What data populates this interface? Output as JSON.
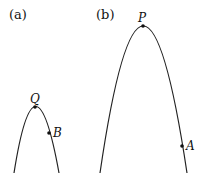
{
  "figure": {
    "panels": [
      {
        "label": "(a)",
        "curve": "downward parabola (narrow, short)",
        "vertex": {
          "name": "Q",
          "x": 35,
          "y": 107
        },
        "points": [
          {
            "name": "B",
            "x": 49,
            "y": 133
          }
        ],
        "ends": [
          {
            "x": 14,
            "y": 173
          },
          {
            "x": 59,
            "y": 173
          }
        ]
      },
      {
        "label": "(b)",
        "curve": "downward parabola (wide, tall)",
        "vertex": {
          "name": "P",
          "x": 143,
          "y": 26
        },
        "points": [
          {
            "name": "A",
            "x": 182,
            "y": 146
          }
        ],
        "ends": [
          {
            "x": 100,
            "y": 173
          },
          {
            "x": 187,
            "y": 173
          }
        ]
      }
    ],
    "colors": {
      "stroke": "#222222",
      "background": "#ffffff"
    }
  }
}
